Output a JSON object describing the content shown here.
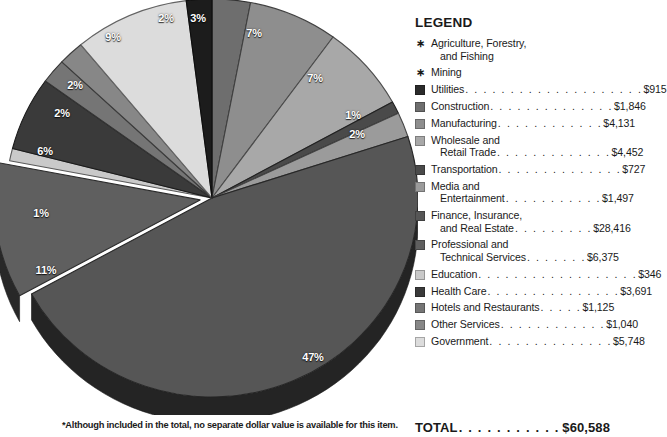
{
  "chart_data": {
    "type": "pie",
    "title": "",
    "legend_position": "right",
    "total_label": "TOTAL",
    "total_value": "$60,588",
    "footnote": "*Although included in the total, no separate dollar value is available for this item.",
    "categories": [
      "Agriculture, Forestry, and Fishing",
      "Mining",
      "Utilities",
      "Construction",
      "Manufacturing",
      "Wholesale and Retail Trade",
      "Transportation",
      "Media and Entertainment",
      "Finance, Insurance, and Real Estate",
      "Professional and Technical Services",
      "Education",
      "Health Care",
      "Hotels and Restaurants",
      "Other Services",
      "Government"
    ],
    "values": [
      null,
      null,
      915,
      1846,
      4131,
      4452,
      727,
      1497,
      28416,
      6375,
      346,
      3691,
      1125,
      1040,
      5748
    ],
    "percent_labels": [
      "2%",
      "3%",
      "7%",
      "7%",
      "1%",
      "2%",
      "47%",
      "11%",
      "1%",
      "6%",
      "2%",
      "2%",
      "9%"
    ]
  },
  "legend": {
    "title": "LEGEND",
    "items": [
      {
        "marker": "asterisk",
        "color": "#000000",
        "line1": "Agriculture, Forestry,",
        "line2": "and Fishing",
        "dots": "",
        "amount": ""
      },
      {
        "marker": "asterisk",
        "color": "#000000",
        "line1": "Mining",
        "line2": "",
        "dots": "",
        "amount": ""
      },
      {
        "marker": "swatch",
        "color": "#2b2b2b",
        "line1": "Utilities",
        "line2": "",
        "dots": ". . . . . . . . . . . . . . . . . . . .",
        "amount": "$915"
      },
      {
        "marker": "swatch",
        "color": "#6e6e6e",
        "line1": "Construction",
        "line2": "",
        "dots": ". . . . . . . . . . . . . .",
        "amount": "$1,846"
      },
      {
        "marker": "swatch",
        "color": "#8e8e8e",
        "line1": "Manufacturing",
        "line2": "",
        "dots": ". . . . . . . . . . . .",
        "amount": "$4,131"
      },
      {
        "marker": "swatch",
        "color": "#a8a8a8",
        "line1": "Wholesale and",
        "line2": "Retail Trade",
        "dots": ". . . . . . . . . . . . .",
        "amount": "$4,452"
      },
      {
        "marker": "swatch",
        "color": "#4a4a4a",
        "line1": "Transportation",
        "line2": "",
        "dots": ". . . . . . . . . . . . . .",
        "amount": "$727"
      },
      {
        "marker": "swatch",
        "color": "#9b9b9b",
        "line1": "Media and",
        "line2": "Entertainment",
        "dots": ". . . . . . . . . . .",
        "amount": "$1,497"
      },
      {
        "marker": "swatch",
        "color": "#565656",
        "line1": "Finance, Insurance,",
        "line2": "and Real Estate",
        "dots": ". . . . . . . . .",
        "amount": "$28,416"
      },
      {
        "marker": "swatch",
        "color": "#5f5f5f",
        "line1": "Professional and",
        "line2": "Technical Services",
        "dots": ". . . . . . .",
        "amount": "$6,375"
      },
      {
        "marker": "swatch",
        "color": "#c9c9c9",
        "line1": "Education",
        "line2": "",
        "dots": ". . . . . . . . . . . . . . . . . .",
        "amount": "$346"
      },
      {
        "marker": "swatch",
        "color": "#3a3a3a",
        "line1": "Health Care",
        "line2": "",
        "dots": ". . . . . . . . . . . . . . .",
        "amount": "$3,691"
      },
      {
        "marker": "swatch",
        "color": "#757575",
        "line1": "Hotels and Restaurants",
        "line2": "",
        "dots": ". . . . .",
        "amount": "$1,125"
      },
      {
        "marker": "swatch",
        "color": "#878787",
        "line1": "Other Services",
        "line2": "",
        "dots": ". . . . . . . . . . . .",
        "amount": "$1,040"
      },
      {
        "marker": "swatch",
        "color": "#dcdcdc",
        "line1": "Government",
        "line2": "",
        "dots": ". . . . . . . . . . . . . .",
        "amount": "$5,748"
      }
    ]
  },
  "pie": {
    "slices": [
      {
        "name": "construction",
        "pct": "3%",
        "color": "#6e6e6e",
        "lx": 198,
        "ly": 18
      },
      {
        "name": "manufacturing",
        "pct": "7%",
        "color": "#8e8e8e",
        "lx": 254,
        "ly": 33
      },
      {
        "name": "wholesale-retail",
        "pct": "7%",
        "color": "#a8a8a8",
        "lx": 315,
        "ly": 78
      },
      {
        "name": "transportation",
        "pct": "1%",
        "color": "#4a4a4a",
        "lx": 353,
        "ly": 115
      },
      {
        "name": "media-entertainment",
        "pct": "2%",
        "color": "#9b9b9b",
        "lx": 357,
        "ly": 134
      },
      {
        "name": "finance-insurance-realestate",
        "pct": "47%",
        "color": "#565656",
        "lx": 313,
        "ly": 357
      },
      {
        "name": "professional-technical",
        "pct": "11%",
        "color": "#5f5f5f",
        "lx": 46,
        "ly": 270
      },
      {
        "name": "education",
        "pct": "1%",
        "color": "#c9c9c9",
        "lx": 41,
        "ly": 213
      },
      {
        "name": "health-care",
        "pct": "6%",
        "color": "#3a3a3a",
        "lx": 45,
        "ly": 151
      },
      {
        "name": "hotels-restaurants",
        "pct": "2%",
        "color": "#757575",
        "lx": 62,
        "ly": 113
      },
      {
        "name": "other-services",
        "pct": "2%",
        "color": "#878787",
        "lx": 75,
        "ly": 85
      },
      {
        "name": "government",
        "pct": "9%",
        "color": "#dcdcdc",
        "lx": 113,
        "ly": 37
      },
      {
        "name": "utilities",
        "pct": "2%",
        "color": "#1c1c1c",
        "lx": 166,
        "ly": 18
      }
    ]
  }
}
